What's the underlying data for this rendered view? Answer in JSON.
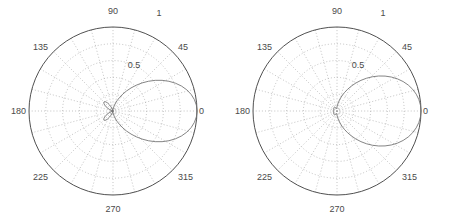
{
  "figure": {
    "title": "",
    "background": "#ffffff",
    "panel_count": 2
  },
  "colors": {
    "outer_circle": "#3c3c3c",
    "gridline": "#9a9a9a",
    "curve": "#6e6e6e",
    "label_text": "#4a4a4a",
    "background": "#ffffff"
  },
  "chart_data": [
    {
      "type": "line",
      "plot_kind": "polar",
      "title": "",
      "xlabel": "",
      "ylabel": "",
      "panel_index": 0,
      "angle_unit": "degrees",
      "angle_tick_labels": [
        "0",
        "45",
        "90",
        "135",
        "180",
        "225",
        "270",
        "315"
      ],
      "angle_ticks": [
        0,
        45,
        90,
        135,
        180,
        225,
        270,
        315
      ],
      "radial_tick_labels": [
        "0.5",
        "1"
      ],
      "radial_ticks": [
        0.5,
        1.0
      ],
      "rlim": [
        0,
        1
      ],
      "grid": true,
      "grid_angle_step_deg": 15,
      "grid_radial_step": 0.2,
      "legend": "none",
      "series": [
        {
          "name": "pattern-left",
          "theta_deg": [
            0,
            4,
            8,
            12,
            16,
            20,
            24,
            28,
            32,
            36,
            40,
            44,
            48,
            52,
            56,
            60,
            64,
            68,
            72,
            76,
            80,
            84,
            88,
            92,
            96,
            100,
            104,
            108,
            112,
            116,
            120,
            124,
            128,
            132,
            136,
            140,
            144,
            148,
            152,
            156,
            160,
            164,
            168,
            172,
            176,
            180,
            184,
            188,
            192,
            196,
            200,
            204,
            208,
            212,
            216,
            220,
            224,
            228,
            232,
            236,
            240,
            244,
            248,
            252,
            256,
            260,
            264,
            268,
            272,
            276,
            280,
            284,
            288,
            292,
            296,
            300,
            304,
            308,
            312,
            316,
            320,
            324,
            328,
            332,
            336,
            340,
            344,
            348,
            352,
            356,
            360
          ],
          "r": [
            1.0,
            0.995,
            0.978,
            0.951,
            0.914,
            0.868,
            0.814,
            0.754,
            0.689,
            0.621,
            0.551,
            0.481,
            0.413,
            0.348,
            0.287,
            0.231,
            0.181,
            0.137,
            0.1,
            0.07,
            0.046,
            0.028,
            0.016,
            0.008,
            0.004,
            0.002,
            0.004,
            0.012,
            0.03,
            0.056,
            0.086,
            0.115,
            0.138,
            0.151,
            0.152,
            0.142,
            0.123,
            0.099,
            0.073,
            0.048,
            0.027,
            0.012,
            0.004,
            0.002,
            0.006,
            0.012,
            0.006,
            0.002,
            0.004,
            0.012,
            0.027,
            0.048,
            0.073,
            0.099,
            0.123,
            0.142,
            0.152,
            0.151,
            0.138,
            0.115,
            0.086,
            0.056,
            0.03,
            0.012,
            0.004,
            0.002,
            0.004,
            0.008,
            0.016,
            0.028,
            0.046,
            0.07,
            0.1,
            0.137,
            0.181,
            0.231,
            0.287,
            0.348,
            0.413,
            0.481,
            0.551,
            0.621,
            0.689,
            0.754,
            0.814,
            0.868,
            0.914,
            0.951,
            0.978,
            0.995,
            1.0
          ],
          "description": "narrow main lobe centered at 0 degrees with small side/back lobes near center"
        }
      ]
    },
    {
      "type": "line",
      "plot_kind": "polar",
      "title": "",
      "xlabel": "",
      "ylabel": "",
      "panel_index": 1,
      "angle_unit": "degrees",
      "angle_tick_labels": [
        "0",
        "45",
        "90",
        "135",
        "180",
        "225",
        "270",
        "315"
      ],
      "angle_ticks": [
        0,
        45,
        90,
        135,
        180,
        225,
        270,
        315
      ],
      "radial_tick_labels": [
        "0.5",
        "1"
      ],
      "radial_ticks": [
        0.5,
        1.0
      ],
      "rlim": [
        0,
        1
      ],
      "grid": true,
      "grid_angle_step_deg": 15,
      "grid_radial_step": 0.2,
      "legend": "none",
      "series": [
        {
          "name": "pattern-right",
          "theta_deg": [
            0,
            4,
            8,
            12,
            16,
            20,
            24,
            28,
            32,
            36,
            40,
            44,
            48,
            52,
            56,
            60,
            64,
            68,
            72,
            76,
            80,
            84,
            88,
            92,
            96,
            100,
            104,
            108,
            112,
            116,
            120,
            124,
            128,
            132,
            136,
            140,
            144,
            148,
            152,
            156,
            160,
            164,
            168,
            172,
            176,
            180,
            184,
            188,
            192,
            196,
            200,
            204,
            208,
            212,
            216,
            220,
            224,
            228,
            232,
            236,
            240,
            244,
            248,
            252,
            256,
            260,
            264,
            268,
            272,
            276,
            280,
            284,
            288,
            292,
            296,
            300,
            304,
            308,
            312,
            316,
            320,
            324,
            328,
            332,
            336,
            340,
            344,
            348,
            352,
            356,
            360
          ],
          "r": [
            1.0,
            0.996,
            0.984,
            0.964,
            0.937,
            0.903,
            0.862,
            0.815,
            0.763,
            0.707,
            0.648,
            0.587,
            0.525,
            0.463,
            0.402,
            0.343,
            0.288,
            0.236,
            0.189,
            0.147,
            0.111,
            0.081,
            0.058,
            0.042,
            0.033,
            0.03,
            0.032,
            0.036,
            0.042,
            0.047,
            0.051,
            0.054,
            0.055,
            0.055,
            0.054,
            0.052,
            0.05,
            0.048,
            0.046,
            0.045,
            0.044,
            0.044,
            0.044,
            0.044,
            0.044,
            0.044,
            0.044,
            0.044,
            0.044,
            0.044,
            0.044,
            0.045,
            0.046,
            0.048,
            0.05,
            0.052,
            0.054,
            0.055,
            0.055,
            0.054,
            0.051,
            0.047,
            0.042,
            0.036,
            0.032,
            0.03,
            0.033,
            0.042,
            0.058,
            0.081,
            0.111,
            0.147,
            0.189,
            0.236,
            0.288,
            0.343,
            0.402,
            0.463,
            0.525,
            0.587,
            0.648,
            0.707,
            0.763,
            0.815,
            0.862,
            0.903,
            0.937,
            0.964,
            0.984,
            0.996,
            1.0
          ],
          "description": "broad main lobe centered at 0 degrees with small near-circular back lobe at center"
        }
      ]
    }
  ],
  "panels": [
    {
      "name": "left-polar-plot",
      "angle_labels": [
        {
          "text": "0",
          "deg": 0
        },
        {
          "text": "45",
          "deg": 45
        },
        {
          "text": "90",
          "deg": 90
        },
        {
          "text": "135",
          "deg": 135
        },
        {
          "text": "180",
          "deg": 180
        },
        {
          "text": "225",
          "deg": 225
        },
        {
          "text": "270",
          "deg": 270
        },
        {
          "text": "315",
          "deg": 315
        }
      ],
      "radial_labels": [
        {
          "text": "0.5",
          "r": 0.5
        },
        {
          "text": "1",
          "r": 1.0
        }
      ]
    },
    {
      "name": "right-polar-plot",
      "angle_labels": [
        {
          "text": "0",
          "deg": 0
        },
        {
          "text": "45",
          "deg": 45
        },
        {
          "text": "90",
          "deg": 90
        },
        {
          "text": "135",
          "deg": 135
        },
        {
          "text": "180",
          "deg": 180
        },
        {
          "text": "225",
          "deg": 225
        },
        {
          "text": "270",
          "deg": 270
        },
        {
          "text": "315",
          "deg": 315
        }
      ],
      "radial_labels": [
        {
          "text": "0.5",
          "r": 0.5
        },
        {
          "text": "1",
          "r": 1.0
        }
      ]
    }
  ]
}
